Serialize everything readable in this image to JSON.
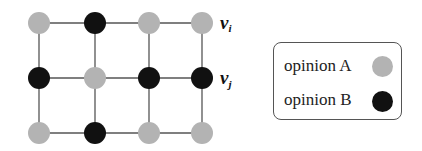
{
  "diagram": {
    "grid": {
      "cols": [
        39,
        95,
        149,
        202
      ],
      "rows": [
        23,
        78,
        133
      ],
      "nodes": [
        [
          "A",
          "B",
          "A",
          "A"
        ],
        [
          "B",
          "A",
          "B",
          "B"
        ],
        [
          "A",
          "B",
          "A",
          "A"
        ]
      ]
    },
    "labels": {
      "vi": {
        "text": "v",
        "sub": "i"
      },
      "vj": {
        "text": "v",
        "sub": "j"
      }
    },
    "colors": {
      "A": "#b3b3b3",
      "B": "#111111",
      "edge": "#555555"
    }
  },
  "legend": {
    "items": [
      {
        "label": "opinion A",
        "opinion": "A"
      },
      {
        "label": "opinion B",
        "opinion": "B"
      }
    ]
  }
}
